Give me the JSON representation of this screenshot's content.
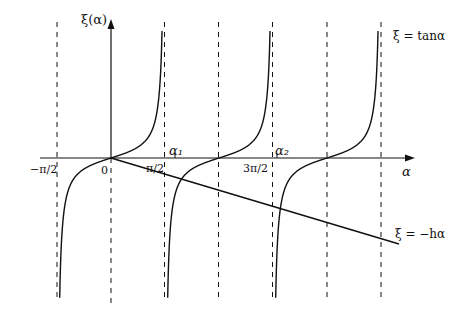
{
  "figure": {
    "y_axis_label": "ξ(α)",
    "x_axis_label": "α",
    "curve_label_tan": "ξ = tanα",
    "curve_label_line": "ξ = −hα",
    "tick_labels": [
      {
        "text": "−π/2",
        "x": 34,
        "y": 173
      },
      {
        "text": "0",
        "x": 101,
        "y": 173
      },
      {
        "text": "π/2",
        "x": 146,
        "y": 173
      },
      {
        "text": "3π/2",
        "x": 243,
        "y": 173
      },
      {
        "text": "α₁",
        "x": 170,
        "y": 156
      },
      {
        "text": "α₂",
        "x": 276,
        "y": 156
      }
    ],
    "colors": {
      "ink": "#111111",
      "background": "#ffffff"
    }
  },
  "chart_data": {
    "type": "line",
    "title": "",
    "xlabel": "α",
    "ylabel": "ξ(α)",
    "series": [
      {
        "name": "ξ = tanα",
        "function": "tan(alpha)",
        "branches": [
          [
            -1.5708,
            1.5708
          ],
          [
            1.5708,
            4.7124
          ],
          [
            4.7124,
            7.854
          ]
        ]
      },
      {
        "name": "ξ = −hα",
        "function": "-h*alpha",
        "alpha_range": [
          0,
          8.3
        ]
      }
    ],
    "asymptotes": [
      "−π/2",
      "π/2",
      "π",
      "3π/2",
      "2π",
      "5π/2"
    ],
    "roots_marked": [
      "α1",
      "α2"
    ],
    "annotations": [
      "−π/2",
      "0",
      "π/2",
      "3π/2",
      "α1",
      "α2"
    ],
    "grid": false
  }
}
